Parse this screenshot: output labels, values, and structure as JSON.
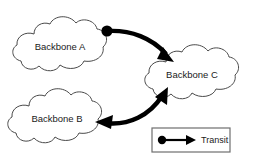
{
  "diagram": {
    "background_color": "#ffffff",
    "width": 258,
    "height": 160,
    "nodes": [
      {
        "id": "backbone-a",
        "label": "Backbone A",
        "shape": "cloud",
        "center_x": 72,
        "center_y": 46,
        "fill": "#ffffff",
        "stroke": "#4a4a4a"
      },
      {
        "id": "backbone-b",
        "label": "Backbone B",
        "shape": "cloud",
        "center_x": 67,
        "center_y": 118,
        "fill": "#ffffff",
        "stroke": "#4a4a4a"
      },
      {
        "id": "backbone-c",
        "label": "Backbone C",
        "shape": "cloud",
        "center_x": 196,
        "center_y": 74,
        "fill": "#ffffff",
        "stroke": "#4a4a4a"
      }
    ],
    "links": [
      {
        "id": "link-a-to-c",
        "from": "backbone-a",
        "to": "backbone-c",
        "relationship": "Transit",
        "start_marker": "dot",
        "end_marker": "arrow",
        "color": "#000000"
      },
      {
        "id": "link-b-to-c",
        "from": "backbone-b",
        "to": "backbone-c",
        "relationship": "Transit",
        "start_marker": "arrow",
        "end_marker": "arrow",
        "color": "#000000"
      }
    ]
  },
  "legend": {
    "title": "",
    "border_color": "#6e6e6e",
    "background_color": "#ffffff",
    "entries": [
      {
        "id": "legend-transit",
        "label": "Transit",
        "symbol": "dot-line-arrow",
        "color": "#000000"
      }
    ]
  }
}
